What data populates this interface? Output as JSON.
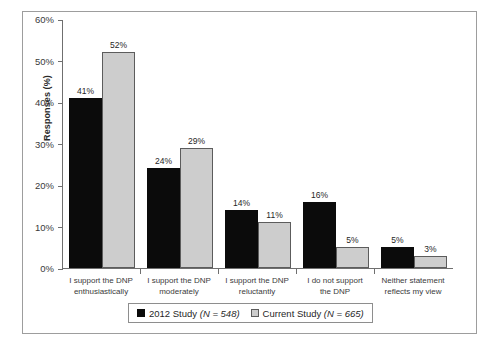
{
  "chart_data": {
    "type": "bar",
    "title": "",
    "subtitle": "",
    "xlabel": "",
    "ylabel": "Responses (%)",
    "ylim": [
      0,
      60
    ],
    "ytick_labels": [
      "0%",
      "10%",
      "20%",
      "30%",
      "40%",
      "50%",
      "60%"
    ],
    "ytick_values": [
      0,
      10,
      20,
      30,
      40,
      50,
      60
    ],
    "grid": false,
    "legend_position": "bottom",
    "categories": [
      "I support the DNP enthusiastically",
      "I support the DNP moderately",
      "I support the DNP reluctantly",
      "I do not support the DNP",
      "Neither statement reflects my view"
    ],
    "category_lines": [
      [
        "I support the DNP",
        "enthusiastically"
      ],
      [
        "I support the DNP",
        "moderately"
      ],
      [
        "I support the DNP",
        "reluctantly"
      ],
      [
        "I do not support",
        "the DNP"
      ],
      [
        "Neither statement",
        "reflects my view"
      ]
    ],
    "series": [
      {
        "name": "2012 Study (N = 548)",
        "legend_label": "2012 Study",
        "legend_n": "(N = 548)",
        "color": "#0b0b0b",
        "values": [
          41,
          24,
          14,
          16,
          5
        ],
        "value_labels": [
          "41%",
          "24%",
          "14%",
          "16%",
          "5%"
        ]
      },
      {
        "name": "Current Study (N = 665)",
        "legend_label": "Current Study",
        "legend_n": "(N = 665)",
        "color": "#cdcdcd",
        "values": [
          52,
          29,
          11,
          5,
          3
        ],
        "value_labels": [
          "52%",
          "29%",
          "11%",
          "5%",
          "3%"
        ]
      }
    ]
  }
}
